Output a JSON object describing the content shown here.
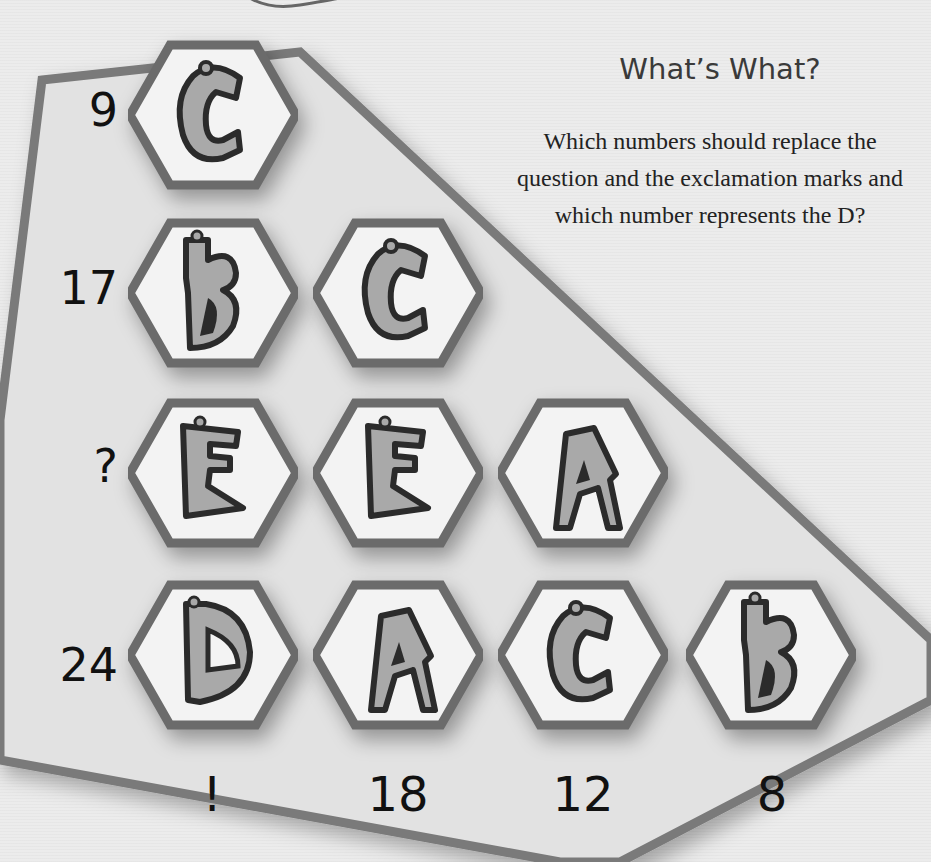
{
  "puzzle": {
    "title": "What’s What?",
    "question": "Which numbers should replace the question and the exclamation marks and which number represents the D?",
    "rows": [
      {
        "label": "9",
        "tiles": [
          "C"
        ]
      },
      {
        "label": "17",
        "tiles": [
          "B",
          "C"
        ]
      },
      {
        "label": "?",
        "tiles": [
          "E",
          "E",
          "A"
        ]
      },
      {
        "label": "24",
        "tiles": [
          "D",
          "A",
          "C",
          "B"
        ]
      }
    ],
    "columns": [
      {
        "label": "!"
      },
      {
        "label": "18"
      },
      {
        "label": "12"
      },
      {
        "label": "8"
      }
    ]
  },
  "colors": {
    "background": "#ececec",
    "board_fill": "#e2e2e2",
    "board_border": "#7a7a7a",
    "hex_border": "#6b6b6b",
    "hex_fill": "#f3f3f3",
    "letter_fill": "#a9a9a9",
    "letter_outline": "#2b2b2b",
    "text": "#111111"
  }
}
